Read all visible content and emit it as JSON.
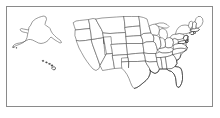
{
  "figure": {
    "width": 220,
    "height": 118,
    "background_color": "#ffffff",
    "frame": {
      "name": "map-border-frame",
      "color": "#8a8a8a",
      "inset_px": 6,
      "line_width_px": 1
    },
    "line_color": "#4a4a4a",
    "fill_color": "#ffffff",
    "projection_note": "Alaska and Hawaii shown as insets at left"
  },
  "map": {
    "name": "us-states-map",
    "region_groups": [
      {
        "name": "alaska-inset",
        "label": "Alaska",
        "bounds_px": [
          12,
          14,
          62,
          48
        ]
      },
      {
        "name": "hawaii-inset",
        "label": "Hawaii",
        "bounds_px": [
          40,
          58,
          60,
          72
        ]
      },
      {
        "name": "continental-us",
        "label": "Contiguous United States",
        "bounds_px": [
          66,
          16,
          212,
          104
        ]
      }
    ],
    "states": [
      {
        "code": "AK",
        "name": "Alaska"
      },
      {
        "code": "HI",
        "name": "Hawaii"
      },
      {
        "code": "WA",
        "name": "Washington"
      },
      {
        "code": "OR",
        "name": "Oregon"
      },
      {
        "code": "CA",
        "name": "California"
      },
      {
        "code": "NV",
        "name": "Nevada"
      },
      {
        "code": "ID",
        "name": "Idaho"
      },
      {
        "code": "MT",
        "name": "Montana"
      },
      {
        "code": "WY",
        "name": "Wyoming"
      },
      {
        "code": "UT",
        "name": "Utah"
      },
      {
        "code": "AZ",
        "name": "Arizona"
      },
      {
        "code": "CO",
        "name": "Colorado"
      },
      {
        "code": "NM",
        "name": "New Mexico"
      },
      {
        "code": "ND",
        "name": "North Dakota"
      },
      {
        "code": "SD",
        "name": "South Dakota"
      },
      {
        "code": "NE",
        "name": "Nebraska"
      },
      {
        "code": "KS",
        "name": "Kansas"
      },
      {
        "code": "OK",
        "name": "Oklahoma"
      },
      {
        "code": "TX",
        "name": "Texas"
      },
      {
        "code": "MN",
        "name": "Minnesota"
      },
      {
        "code": "IA",
        "name": "Iowa"
      },
      {
        "code": "MO",
        "name": "Missouri"
      },
      {
        "code": "AR",
        "name": "Arkansas"
      },
      {
        "code": "LA",
        "name": "Louisiana"
      },
      {
        "code": "WI",
        "name": "Wisconsin"
      },
      {
        "code": "IL",
        "name": "Illinois"
      },
      {
        "code": "MI",
        "name": "Michigan"
      },
      {
        "code": "IN",
        "name": "Indiana"
      },
      {
        "code": "OH",
        "name": "Ohio"
      },
      {
        "code": "KY",
        "name": "Kentucky"
      },
      {
        "code": "TN",
        "name": "Tennessee"
      },
      {
        "code": "MS",
        "name": "Mississippi"
      },
      {
        "code": "AL",
        "name": "Alabama"
      },
      {
        "code": "GA",
        "name": "Georgia"
      },
      {
        "code": "FL",
        "name": "Florida"
      },
      {
        "code": "SC",
        "name": "South Carolina"
      },
      {
        "code": "NC",
        "name": "North Carolina"
      },
      {
        "code": "VA",
        "name": "Virginia"
      },
      {
        "code": "WV",
        "name": "West Virginia"
      },
      {
        "code": "MD",
        "name": "Maryland"
      },
      {
        "code": "DE",
        "name": "Delaware"
      },
      {
        "code": "PA",
        "name": "Pennsylvania"
      },
      {
        "code": "NJ",
        "name": "New Jersey"
      },
      {
        "code": "NY",
        "name": "New York"
      },
      {
        "code": "CT",
        "name": "Connecticut"
      },
      {
        "code": "RI",
        "name": "Rhode Island"
      },
      {
        "code": "MA",
        "name": "Massachusetts"
      },
      {
        "code": "VT",
        "name": "Vermont"
      },
      {
        "code": "NH",
        "name": "New Hampshire"
      },
      {
        "code": "ME",
        "name": "Maine"
      }
    ],
    "state_count": 50
  }
}
